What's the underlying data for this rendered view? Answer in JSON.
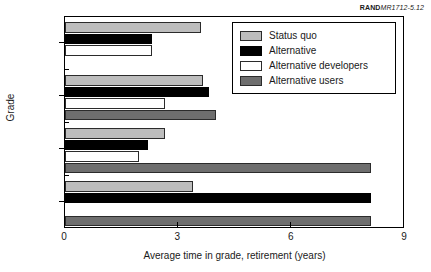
{
  "source_note": {
    "mark": "RAND",
    "id": "MR1712-5.12"
  },
  "chart_data": {
    "type": "bar",
    "orientation": "horizontal",
    "title": "",
    "xlabel": "Average time in grade, retirement (years)",
    "ylabel": "Grade",
    "categories": [
      "O-7",
      "O-8",
      "O-9",
      "O-10"
    ],
    "xlim": [
      0,
      9
    ],
    "xticks": [
      0,
      3,
      6,
      9
    ],
    "xtick_labels": [
      "0",
      "3",
      "6",
      "9"
    ],
    "grid": false,
    "legend_position": "upper right",
    "series": [
      {
        "name": "Status quo",
        "color": "#bdbdbd",
        "values": [
          3.6,
          3.65,
          2.65,
          3.4
        ]
      },
      {
        "name": "Alternative",
        "color": "#000000",
        "values": [
          2.3,
          3.8,
          2.2,
          8.1
        ]
      },
      {
        "name": "Alternative developers",
        "color": "#ffffff",
        "values": [
          2.3,
          2.65,
          1.95,
          0
        ]
      },
      {
        "name": "Alternative users",
        "color": "#6e6e6e",
        "values": [
          0,
          4.0,
          8.1,
          8.1
        ]
      }
    ]
  },
  "legend": {
    "items": [
      {
        "label": "Status quo",
        "swatch": "statusquo"
      },
      {
        "label": "Alternative",
        "swatch": "alternative"
      },
      {
        "label": "Alternative developers",
        "swatch": "altdev"
      },
      {
        "label": "Alternative users",
        "swatch": "altusers"
      }
    ]
  }
}
